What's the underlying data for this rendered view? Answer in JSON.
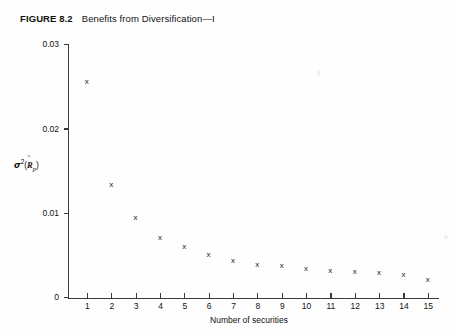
{
  "figure": {
    "label": "FIGURE 8.2",
    "title": "Benefits from Diversification—I"
  },
  "axes": {
    "y_ticks": [
      "0",
      "0.01",
      "0.02",
      "0.03"
    ],
    "x_ticks": [
      "1",
      "2",
      "3",
      "4",
      "5",
      "6",
      "7",
      "8",
      "9",
      "10",
      "11",
      "12",
      "13",
      "14",
      "15"
    ],
    "x_title": "Number of securities",
    "y_title_sigma": "σ",
    "y_title_exponent": "2",
    "y_title_open": "(",
    "y_title_var": "R",
    "y_title_tilde": "̃",
    "y_title_sub": "p",
    "y_title_close": ")"
  },
  "marker": {
    "glyph": "x"
  },
  "colors": {
    "background": "#fefefe",
    "axis": "#3a3a3a",
    "text": "#111111",
    "marker": "#1a1a1a"
  },
  "chart_data": {
    "type": "scatter",
    "xlabel": "Number of securities",
    "ylabel": "σ²(R̃ₚ)",
    "xlim": [
      0,
      15.6
    ],
    "ylim": [
      0,
      0.03
    ],
    "grid": false,
    "legend": "none",
    "marker": "x",
    "x": [
      1,
      2,
      3,
      4,
      5,
      6,
      7,
      8,
      9,
      10,
      11,
      12,
      13,
      14,
      15
    ],
    "y": [
      0.0256,
      0.0134,
      0.0095,
      0.0071,
      0.006,
      0.0051,
      0.0043,
      0.0039,
      0.0037,
      0.0034,
      0.0031,
      0.003,
      0.0029,
      0.0027,
      0.0021
    ],
    "categories": [
      "1",
      "2",
      "3",
      "4",
      "5",
      "6",
      "7",
      "8",
      "9",
      "10",
      "11",
      "12",
      "13",
      "14",
      "15"
    ],
    "values": [
      0.0256,
      0.0134,
      0.0095,
      0.0071,
      0.006,
      0.0051,
      0.0043,
      0.0039,
      0.0037,
      0.0034,
      0.0031,
      0.003,
      0.0029,
      0.0027,
      0.0021
    ]
  }
}
